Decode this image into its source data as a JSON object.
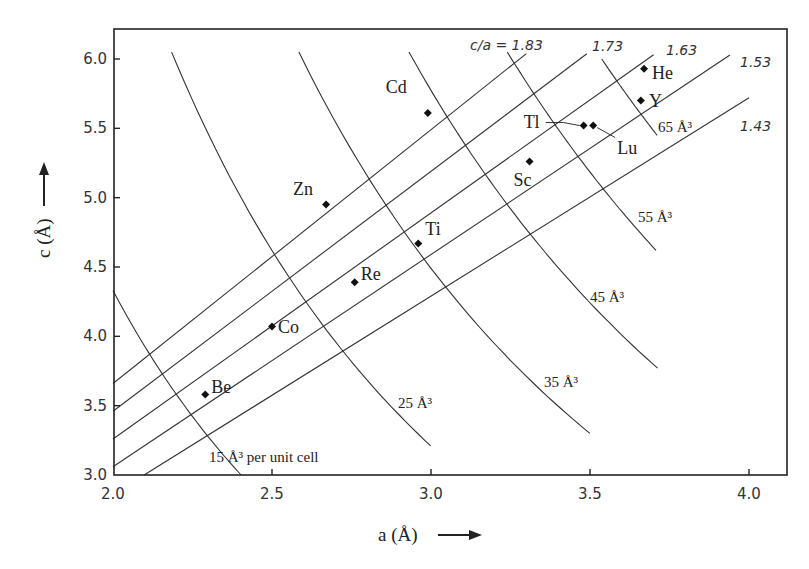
{
  "chart_data": {
    "type": "scatter",
    "title": "",
    "xlabel": "a (Å)",
    "ylabel": "c (Å)",
    "xlim": [
      2.0,
      4.1
    ],
    "ylim": [
      3.0,
      6.2
    ],
    "xticks": [
      2.0,
      2.5,
      3.0,
      3.5,
      4.0
    ],
    "xtick_labels": [
      "2.0",
      "2.5",
      "3.0",
      "3.5",
      "4.0"
    ],
    "yticks": [
      3.0,
      3.5,
      4.0,
      4.5,
      5.0,
      5.5,
      6.0
    ],
    "ytick_labels": [
      "3.0",
      "3.5",
      "4.0",
      "4.5",
      "5.0",
      "5.5",
      "6.0"
    ],
    "grid": false,
    "legend": null,
    "points": [
      {
        "label": "Be",
        "a": 2.29,
        "c": 3.58,
        "label_dx": 6,
        "label_dy": -2
      },
      {
        "label": "Co",
        "a": 2.5,
        "c": 4.07,
        "label_dx": 6,
        "label_dy": 6
      },
      {
        "label": "Re",
        "a": 2.76,
        "c": 4.39,
        "label_dx": 6,
        "label_dy": -2
      },
      {
        "label": "Ti",
        "a": 2.96,
        "c": 4.67,
        "label_dx": 7,
        "label_dy": -8
      },
      {
        "label": "Zn",
        "a": 2.67,
        "c": 4.95,
        "label_dx": -33,
        "label_dy": -10
      },
      {
        "label": "Cd",
        "a": 2.99,
        "c": 5.61,
        "label_dx": -42,
        "label_dy": -20
      },
      {
        "label": "Sc",
        "a": 3.31,
        "c": 5.26,
        "label_dx": -16,
        "label_dy": 24
      },
      {
        "label": "Tl",
        "a": 3.48,
        "c": 5.52,
        "label_dx": -60,
        "label_dy": 2,
        "leader": true
      },
      {
        "label": "Lu",
        "a": 3.51,
        "c": 5.52,
        "label_dx": 24,
        "label_dy": 28,
        "leader": true
      },
      {
        "label": "Y",
        "a": 3.66,
        "c": 5.7,
        "label_dx": 8,
        "label_dy": 6
      },
      {
        "label": "He",
        "a": 3.67,
        "c": 5.93,
        "label_dx": 8,
        "label_dy": 10
      }
    ],
    "ratio_lines": [
      {
        "ratio": 1.83,
        "label": "c/a = 1.83",
        "a_end": 3.3,
        "label_x": 470,
        "label_y": 50
      },
      {
        "ratio": 1.73,
        "label": "1.73",
        "a_end": 3.49,
        "label_x": 592,
        "label_y": 51
      },
      {
        "ratio": 1.63,
        "label": "1.63",
        "a_end": 3.7,
        "label_x": 666,
        "label_y": 55
      },
      {
        "ratio": 1.53,
        "label": "1.53",
        "a_end": 3.94,
        "label_x": 740,
        "label_y": 67
      },
      {
        "ratio": 1.43,
        "label": "1.43",
        "a_end": 4.0,
        "label_x": 740,
        "label_y": 131
      }
    ],
    "volume_curves": [
      {
        "volume": 15,
        "label": "15 Å³ per unit cell",
        "c_top": 4.33,
        "c_bottom": 3.0,
        "label_x": 209,
        "label_y": 462
      },
      {
        "volume": 25,
        "label": "25 Å³",
        "c_top": 6.05,
        "c_bottom": 3.21,
        "label_x": 398,
        "label_y": 408
      },
      {
        "volume": 35,
        "label": "35 Å³",
        "c_top": 6.05,
        "c_bottom": 3.3,
        "label_x": 544,
        "label_y": 387
      },
      {
        "volume": 45,
        "label": "45 Å³",
        "c_top": 6.05,
        "c_bottom": 3.77,
        "label_x": 590,
        "label_y": 302
      },
      {
        "volume": 55,
        "label": "55 Å³",
        "c_top": 6.05,
        "c_bottom": 4.62,
        "label_x": 638,
        "label_y": 222
      },
      {
        "volume": 65,
        "label": "65 Å³",
        "c_top": 6.0,
        "c_bottom": 5.45,
        "label_x": 658,
        "label_y": 132
      }
    ],
    "volume_formula": "V = (√3/2) · a² · c"
  },
  "axes": {
    "xlabel": "a (Å)",
    "ylabel": "c (Å)"
  }
}
